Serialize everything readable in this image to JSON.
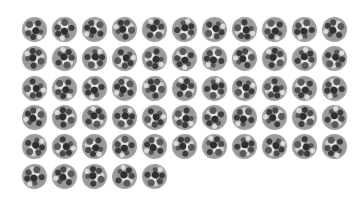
{
  "grid": {
    "columns": 11,
    "rows": 6,
    "item_count": 60,
    "item_diameter_px": 25,
    "col_pitch_px": 30,
    "row_pitch_px": 29.3,
    "item_icon": "textured-gray-sphere-icon",
    "background_color": "#ffffff",
    "texture_colors": [
      "#2f2f2f",
      "#5a5a5a",
      "#9a9a9a",
      "#c8c8c8",
      "#e6e6e6"
    ]
  }
}
